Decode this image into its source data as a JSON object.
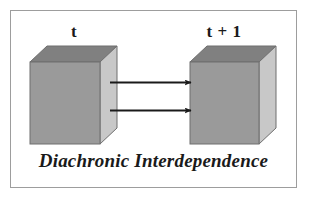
{
  "figure": {
    "caption": "Diachronic Interdependence",
    "background_color": "#ffffff",
    "border_color": "#9d9d9d",
    "labels": {
      "left_cube": "t",
      "right_cube": "t + 1"
    },
    "cubes": [
      {
        "name": "left-cube",
        "label": "t",
        "front_face_color": "#9a9a9a",
        "top_face_color": "#808080",
        "side_face_color": "#c8c8c8",
        "outline_color": "#6f6f6f"
      },
      {
        "name": "right-cube",
        "label": "t + 1",
        "front_face_color": "#9a9a9a",
        "top_face_color": "#808080",
        "side_face_color": "#c8c8c8",
        "outline_color": "#6f6f6f"
      }
    ],
    "arrows": [
      {
        "name": "upper-arrow",
        "direction": "left-to-right",
        "color": "#1a1a1a"
      },
      {
        "name": "lower-arrow",
        "direction": "left-to-right",
        "color": "#1a1a1a"
      }
    ]
  }
}
